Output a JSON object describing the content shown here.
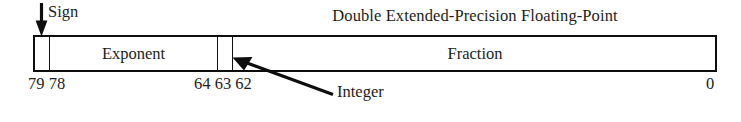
{
  "title": "Double Extended-Precision Floating-Point",
  "callouts": {
    "sign": "Sign",
    "integer": "Integer"
  },
  "fields": [
    {
      "name": "sign",
      "label": "",
      "high_bit": "79",
      "low_bit": "79",
      "width_bits": 1
    },
    {
      "name": "exponent",
      "label": "Exponent",
      "high_bit": "78",
      "low_bit": "64",
      "width_bits": 15
    },
    {
      "name": "integer",
      "label": "",
      "high_bit": "63",
      "low_bit": "63",
      "width_bits": 1
    },
    {
      "name": "fraction",
      "label": "Fraction",
      "high_bit": "62",
      "low_bit": "0",
      "width_bits": 63
    }
  ],
  "bit_labels": {
    "left": "79 78",
    "middle": "64 63 62",
    "right": "0"
  },
  "field_labels": {
    "exponent": "Exponent",
    "fraction": "Fraction"
  },
  "colors": {
    "line": "#0d0d0d",
    "text": "#1d1d1d",
    "background": "#ffffff"
  },
  "icons": {
    "sign_arrow": "down-arrow-icon",
    "integer_arrow": "pointer-arrow-icon"
  }
}
